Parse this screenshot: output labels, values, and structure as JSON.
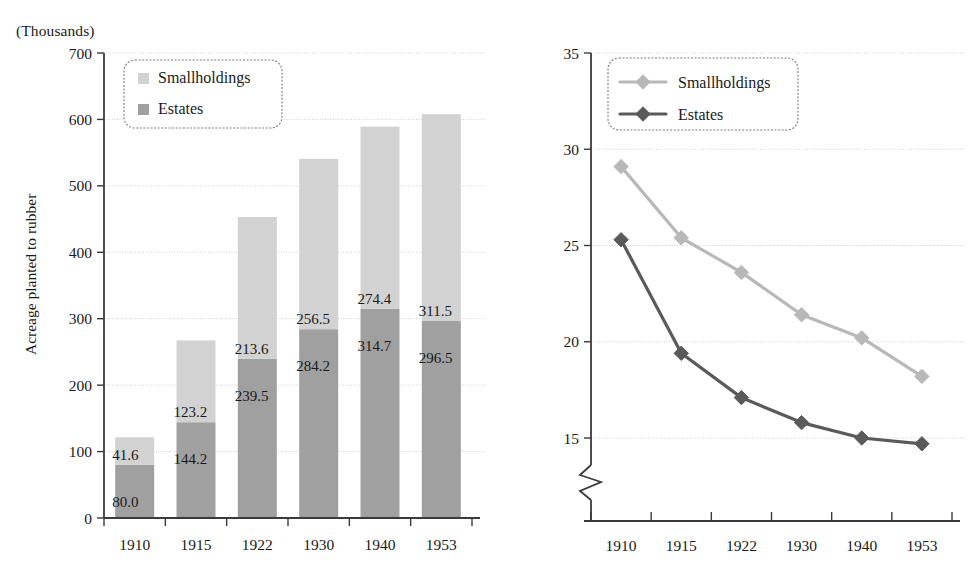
{
  "figure": {
    "background": "#ffffff",
    "panels": [
      "bar-chart-acreage",
      "line-chart-share"
    ]
  },
  "colors": {
    "smallholdings": "#d2d2d2",
    "estates": "#a0a0a0",
    "smallholdings_line": "#b8b8b8",
    "estates_line": "#5a5a5a",
    "axis": "#3a3a3a",
    "gridline": "#c8c8c8",
    "text": "#1a1a1a"
  },
  "left_panel": {
    "unit_label": "(Thousands)",
    "y_axis_title": "Acreage planted to rubber",
    "legend": {
      "items": [
        {
          "label": "Smallholdings",
          "swatch": "#d2d2d2"
        },
        {
          "label": "Estates",
          "swatch": "#a0a0a0"
        }
      ]
    }
  },
  "right_panel": {
    "unit_label": "(%)",
    "y_axis_title": "Share of Perak to Malaya",
    "axis_break": true,
    "legend": {
      "items": [
        {
          "label": "Smallholdings",
          "color": "#b8b8b8"
        },
        {
          "label": "Estates",
          "color": "#5a5a5a"
        }
      ]
    }
  },
  "chart_data": [
    {
      "type": "bar",
      "id": "acreage-planted-to-rubber",
      "stacked": true,
      "title": "",
      "xlabel": "",
      "ylabel": "Acreage planted to rubber",
      "unit": "(Thousands)",
      "categories": [
        "1910",
        "1915",
        "1922",
        "1930",
        "1940",
        "1953"
      ],
      "ylim": [
        0,
        700
      ],
      "yticks": [
        0,
        100,
        200,
        300,
        400,
        500,
        600,
        700
      ],
      "grid": true,
      "legend_position": "top-left",
      "series": [
        {
          "name": "Estates",
          "color": "#a0a0a0",
          "values": [
            80.0,
            144.2,
            239.5,
            284.2,
            314.7,
            296.5
          ],
          "labels": [
            "80.0",
            "144.2",
            "239.5",
            "284.2",
            "314.7",
            "296.5"
          ]
        },
        {
          "name": "Smallholdings",
          "color": "#d2d2d2",
          "values": [
            41.6,
            123.2,
            213.6,
            256.5,
            274.4,
            311.5
          ],
          "labels": [
            "41.6",
            "123.2",
            "213.6",
            "256.5",
            "274.4",
            "311.5"
          ]
        }
      ],
      "totals": [
        121.6,
        267.4,
        453.1,
        540.7,
        589.1,
        608.0
      ]
    },
    {
      "type": "line",
      "id": "share-of-perak-to-malaya",
      "title": "",
      "xlabel": "",
      "ylabel": "Share of Perak to Malaya",
      "unit": "(%)",
      "x": [
        "1910",
        "1915",
        "1922",
        "1930",
        "1940",
        "1953"
      ],
      "ylim": [
        15,
        35
      ],
      "yticks": [
        15,
        20,
        25,
        30,
        35
      ],
      "grid": true,
      "axis_break_below": 15,
      "legend_position": "top-left",
      "marker": "diamond",
      "series": [
        {
          "name": "Smallholdings",
          "color": "#b8b8b8",
          "values": [
            29.1,
            25.4,
            23.6,
            21.4,
            20.2,
            18.2
          ]
        },
        {
          "name": "Estates",
          "color": "#5a5a5a",
          "values": [
            25.3,
            19.4,
            17.1,
            15.8,
            15.0,
            14.7
          ]
        }
      ]
    }
  ]
}
